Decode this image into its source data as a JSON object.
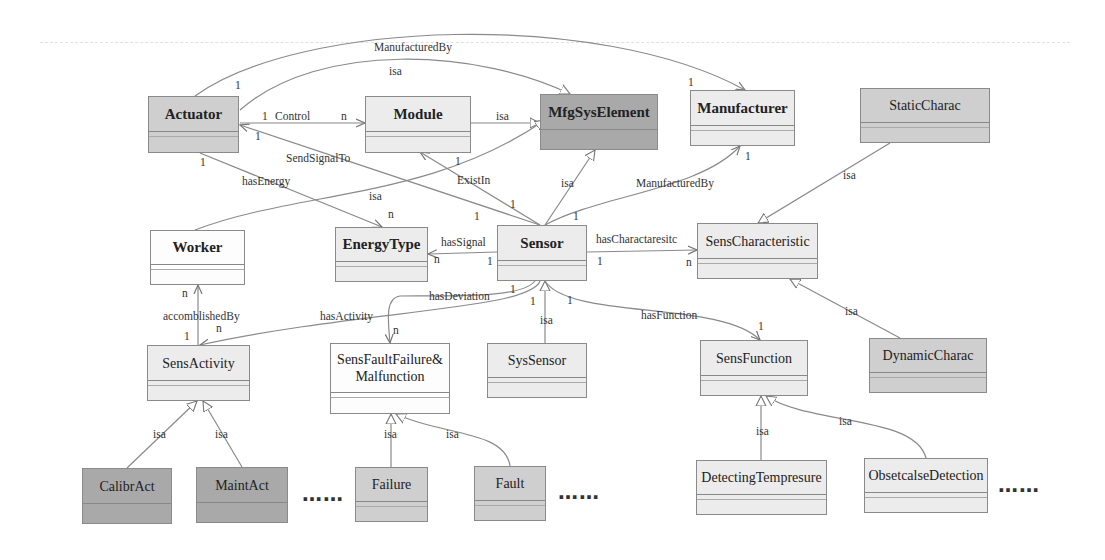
{
  "diagram": {
    "type": "UML class diagram (sensor ontology)",
    "classes": {
      "actuator": "Actuator",
      "module": "Module",
      "mfgsyselement": "MfgSysElement",
      "manufacturer": "Manufacturer",
      "staticcharac": "StaticCharac",
      "worker": "Worker",
      "energytype": "EnergyType",
      "sensor": "Sensor",
      "senscharacteristic": "SensCharacteristic",
      "sensactivity": "SensActivity",
      "sensfault_line1": "SensFaultFailure&",
      "sensfault_line2": "Malfunction",
      "syssensor": "SysSensor",
      "sensfunction": "SensFunction",
      "dynamiccharac": "DynamicCharac",
      "calibract": "CalibrAct",
      "maintact": "MaintAct",
      "failure": "Failure",
      "fault": "Fault",
      "detectingtempresure": "DetectingTempresure",
      "obsetcalsedetection": "ObsetcalseDetection"
    },
    "labels": {
      "manufacturedby_top": "ManufacturedBy",
      "isa_top": "isa",
      "control": "Control",
      "isa_module": "isa",
      "sendsignalto": "SendSignalTo",
      "hasenergy": "hasEnergy",
      "isa_worker": "isa",
      "existin": "ExistIn",
      "isa_sensor": "isa",
      "manufacturedby_sensor": "ManufacturedBy",
      "isa_static": "isa",
      "hassignal": "hasSignal",
      "hascharactaresitc": "hasCharactaresitc",
      "accomblishedby": "accomblishedBy",
      "hasactivity": "hasActivity",
      "hasdeviation": "hasDeviation",
      "isa_syssensor": "isa",
      "hasfunction": "hasFunction",
      "isa_dynamic": "isa",
      "isa_calibr": "isa",
      "isa_maint": "isa",
      "isa_failure": "isa",
      "isa_fault": "isa",
      "isa_detect": "isa",
      "isa_obst": "isa"
    },
    "multiplicities": {
      "m_act_manuf": "1",
      "m_manuf_top": "1",
      "m_act_control": "1",
      "m_module_control": "n",
      "m_act_send": "1",
      "m_act_energy": "1",
      "m_energy_n": "n",
      "m_module_exist": "1",
      "m_sensor_exist": "1",
      "m_sensor_send": "1",
      "m_sensor_manuf": "1",
      "m_manuf_sensor": "1",
      "m_energy_signal": "n",
      "m_sensor_signal": "1",
      "m_sensor_char": "1",
      "m_char_n": "n",
      "m_worker_n": "n",
      "m_activity_1": "1",
      "m_activity_n": "n",
      "m_fault_n": "n",
      "m_sensor_dev1": "1",
      "m_sensor_dev2": "1",
      "m_sensor_func": "1",
      "m_func_1": "1"
    },
    "ellipses": [
      "……",
      "……",
      "……"
    ]
  }
}
